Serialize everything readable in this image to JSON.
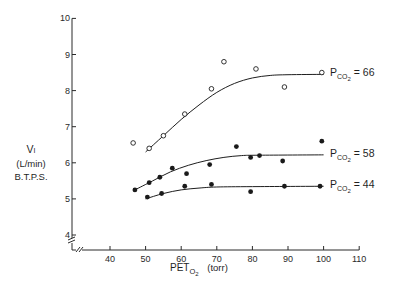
{
  "chart_data": {
    "type": "scatter",
    "title": "",
    "xlabel": "PETO2 (torr)",
    "xlabel_parts": {
      "main": "PET",
      "sub": "O",
      "subsub": "2",
      "unit": "(torr)"
    },
    "ylabel_lines": [
      "VI",
      "(L/min)",
      "B.T.P.S."
    ],
    "ylabel": "VI (L/min) B.T.P.S.",
    "xlim": [
      30,
      110
    ],
    "ylim": [
      3.6,
      10
    ],
    "x_ticks": [
      40,
      50,
      60,
      70,
      80,
      90,
      100,
      110
    ],
    "y_ticks": [
      4,
      5,
      6,
      7,
      8,
      9,
      10
    ],
    "grid": false,
    "axis_break": true,
    "legend_position": "inline-right",
    "series": [
      {
        "name": "PCO2 = 66",
        "label_main": "P",
        "label_sub": "CO",
        "label_subsub": "2",
        "label_value": "= 66",
        "marker": "open-circle",
        "points": [
          [
            46.5,
            6.55
          ],
          [
            51,
            6.4
          ],
          [
            55,
            6.75
          ],
          [
            61,
            7.35
          ],
          [
            68.5,
            8.05
          ],
          [
            72,
            8.8
          ],
          [
            81,
            8.6
          ],
          [
            89,
            8.1
          ],
          [
            99.5,
            8.5
          ]
        ],
        "fit_curve": [
          [
            50,
            6.3
          ],
          [
            55,
            6.75
          ],
          [
            60,
            7.2
          ],
          [
            65,
            7.6
          ],
          [
            70,
            7.95
          ],
          [
            75,
            8.2
          ],
          [
            80,
            8.35
          ],
          [
            85,
            8.42
          ],
          [
            90,
            8.44
          ],
          [
            100,
            8.45
          ]
        ]
      },
      {
        "name": "PCO2 = 58",
        "label_main": "P",
        "label_sub": "CO",
        "label_subsub": "2",
        "label_value": "= 58",
        "marker": "filled-circle",
        "points": [
          [
            47,
            5.25
          ],
          [
            51,
            5.45
          ],
          [
            54,
            5.6
          ],
          [
            57.5,
            5.85
          ],
          [
            61.5,
            5.7
          ],
          [
            68,
            5.95
          ],
          [
            75.5,
            6.45
          ],
          [
            79.5,
            6.15
          ],
          [
            82,
            6.2
          ],
          [
            88.5,
            6.05
          ],
          [
            99.5,
            6.6
          ]
        ],
        "fit_curve": [
          [
            47,
            5.25
          ],
          [
            52,
            5.5
          ],
          [
            57,
            5.75
          ],
          [
            62,
            5.93
          ],
          [
            67,
            6.06
          ],
          [
            72,
            6.15
          ],
          [
            77,
            6.2
          ],
          [
            82,
            6.21
          ],
          [
            100,
            6.22
          ]
        ]
      },
      {
        "name": "PCO2 = 44",
        "label_main": "P",
        "label_sub": "CO",
        "label_subsub": "2",
        "label_value": "= 44",
        "marker": "filled-circle",
        "points": [
          [
            50.5,
            5.05
          ],
          [
            54.5,
            5.15
          ],
          [
            61,
            5.35
          ],
          [
            68.5,
            5.4
          ],
          [
            79.5,
            5.2
          ],
          [
            89,
            5.35
          ],
          [
            99,
            5.35
          ]
        ],
        "fit_curve": [
          [
            50,
            5.0
          ],
          [
            55,
            5.15
          ],
          [
            60,
            5.25
          ],
          [
            65,
            5.3
          ],
          [
            70,
            5.33
          ],
          [
            80,
            5.34
          ],
          [
            100,
            5.35
          ]
        ]
      }
    ]
  },
  "layout": {
    "x_px_at_40": 110,
    "px_per_torr": 3.56,
    "y_px_at_4": 235,
    "px_per_unit": 36.1,
    "axis_x_px": 72,
    "axis_y_px": 250
  }
}
